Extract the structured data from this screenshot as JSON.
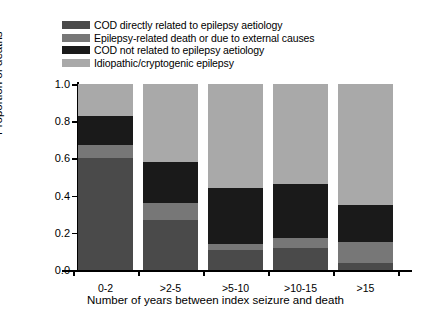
{
  "chart_data": {
    "type": "bar",
    "subtype": "stacked-bar",
    "title": "",
    "xlabel": "Number of years between index seizure and death",
    "ylabel": "Proportion of deaths",
    "categories": [
      "0-2",
      ">2-5",
      ">5-10",
      ">10-15",
      ">15"
    ],
    "ylim": [
      0.0,
      1.0
    ],
    "ytick_labels": [
      "0.0",
      "0.2",
      "0.4",
      "0.6",
      "0.8",
      "1.0"
    ],
    "ytick_values": [
      0.0,
      0.2,
      0.4,
      0.6,
      0.8,
      1.0
    ],
    "grid": false,
    "legend_position": "top-left",
    "stack_order_bottom_to_top": [
      "COD directly related to epilepsy aetiology",
      "Epilepsy-related death or due to external causes",
      "COD not related to epilepsy aetiology",
      "Idiopathic/cryptogenic epilepsy"
    ],
    "series": [
      {
        "name": "COD directly related to epilepsy aetiology",
        "color": "#4a4a4a",
        "values": [
          0.6,
          0.27,
          0.11,
          0.12,
          0.04
        ]
      },
      {
        "name": "Epilepsy-related death or due to external causes",
        "color": "#777777",
        "values": [
          0.07,
          0.09,
          0.03,
          0.05,
          0.11
        ]
      },
      {
        "name": "COD not related to epilepsy aetiology",
        "color": "#1a1a1a",
        "values": [
          0.16,
          0.22,
          0.3,
          0.29,
          0.2
        ]
      },
      {
        "name": "Idiopathic/cryptogenic epilepsy",
        "color": "#a9a9a9",
        "values": [
          0.17,
          0.42,
          0.56,
          0.54,
          0.65
        ]
      }
    ]
  },
  "legend": {
    "items": [
      {
        "label": "COD directly related to epilepsy aetiology",
        "color": "#4a4a4a"
      },
      {
        "label": "Epilepsy-related death or due to external causes",
        "color": "#777777"
      },
      {
        "label": "COD not related to epilepsy aetiology",
        "color": "#1a1a1a"
      },
      {
        "label": "Idiopathic/cryptogenic epilepsy",
        "color": "#a9a9a9"
      }
    ]
  },
  "axes": {
    "y_title": "Proportion of deaths",
    "x_title": "Number of years between index seizure and death"
  }
}
